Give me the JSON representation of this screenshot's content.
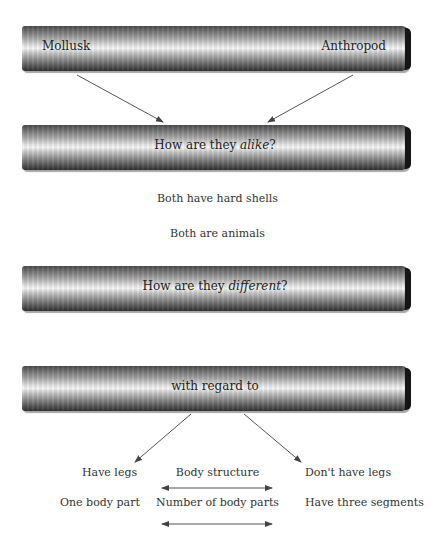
{
  "diagram": {
    "bars": [
      {
        "id": "compare",
        "left_label": "Mollusk",
        "right_label": "Anthropod"
      },
      {
        "id": "alike",
        "label_prefix": "How are they ",
        "label_emphasis": "alike",
        "label_suffix": "?"
      },
      {
        "id": "different",
        "label_prefix": "How are they ",
        "label_emphasis": "different",
        "label_suffix": "?"
      },
      {
        "id": "regard",
        "label": "with regard to"
      }
    ],
    "similarities": [
      "Both have hard shells",
      "Both are animals"
    ],
    "differences": [
      {
        "left": "Have legs",
        "category": "Body structure",
        "right": "Don't have legs"
      },
      {
        "left": "One body part",
        "category": "Number of body parts",
        "right": "Have three segments"
      }
    ],
    "colors": {
      "line": "#555555",
      "text": "#333333",
      "bar_dark": "#2e2e2e",
      "bar_light": "#f4f4f4"
    }
  }
}
